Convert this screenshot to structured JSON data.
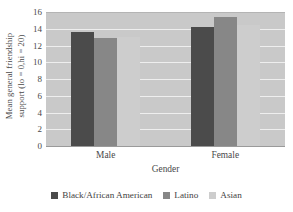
{
  "chart_data": {
    "type": "bar",
    "title": "",
    "subtitle": "",
    "xlabel": "Gender",
    "ylabel": "Mean general friendship support (lo = 0,hi = 20)",
    "ylabel_lines": [
      "Mean general friendship",
      "support (lo = 0,hi = 20)"
    ],
    "categories": [
      "Male",
      "Female"
    ],
    "series": [
      {
        "name": "Black/African American",
        "values": [
          13.7,
          14.3
        ],
        "color": "#4b4b4b"
      },
      {
        "name": "Latino",
        "values": [
          13.0,
          15.5
        ],
        "color": "#878787"
      },
      {
        "name": "Asian",
        "values": [
          13.1,
          14.6
        ],
        "color": "#cdcdcd"
      }
    ],
    "ylim": [
      0,
      16
    ],
    "yticks": [
      0,
      2,
      4,
      6,
      8,
      10,
      12,
      14,
      16
    ],
    "ytick_labels": [
      "0",
      "2",
      "4",
      "6",
      "8",
      "10",
      "12",
      "14",
      "16"
    ],
    "grid": true,
    "grid_axis": "y",
    "legend_position": "bottom",
    "plot_background": "#c9c9c9",
    "gridline_color": "#eeeeee",
    "figure_background": "#ffffff"
  },
  "legend": {
    "entries": [
      {
        "label": "Black/African American"
      },
      {
        "label": "Latino"
      },
      {
        "label": "Asian"
      }
    ]
  }
}
